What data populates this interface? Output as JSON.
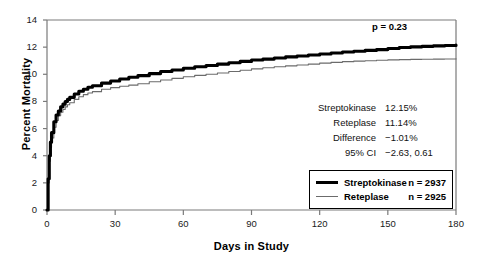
{
  "chart_data": {
    "type": "line",
    "title": "",
    "xlabel": "Days in Study",
    "ylabel": "Percent Mortality",
    "xlim": [
      0,
      180
    ],
    "ylim": [
      0,
      14
    ],
    "xticks": [
      0,
      30,
      60,
      90,
      120,
      150,
      180
    ],
    "yticks": [
      0,
      2,
      4,
      6,
      8,
      10,
      12,
      14
    ],
    "grid": false,
    "legend_position": "lower right",
    "annotations": [
      {
        "name": "p-value",
        "text": "p = 0.23"
      }
    ],
    "series": [
      {
        "name": "Streptokinase",
        "n": 2937,
        "style": "thick-black",
        "final_value": 12.15,
        "x": [
          0,
          0.5,
          1,
          1.5,
          2,
          3,
          4,
          5,
          6,
          7,
          8,
          9,
          10,
          12,
          14,
          16,
          18,
          20,
          24,
          28,
          32,
          36,
          40,
          45,
          50,
          55,
          60,
          65,
          70,
          75,
          80,
          85,
          90,
          95,
          100,
          105,
          110,
          115,
          120,
          125,
          130,
          135,
          140,
          145,
          150,
          155,
          160,
          165,
          170,
          175,
          180
        ],
        "y": [
          0,
          2.3,
          4.0,
          5.0,
          5.7,
          6.5,
          7.0,
          7.3,
          7.6,
          7.8,
          8.0,
          8.15,
          8.3,
          8.55,
          8.75,
          8.9,
          9.05,
          9.15,
          9.35,
          9.5,
          9.65,
          9.78,
          9.9,
          10.05,
          10.2,
          10.32,
          10.45,
          10.55,
          10.65,
          10.75,
          10.85,
          10.95,
          11.05,
          11.12,
          11.2,
          11.28,
          11.35,
          11.42,
          11.5,
          11.57,
          11.64,
          11.7,
          11.76,
          11.82,
          11.9,
          11.97,
          12.02,
          12.06,
          12.09,
          12.12,
          12.15
        ]
      },
      {
        "name": "Reteplase",
        "n": 2925,
        "style": "thin-gray",
        "final_value": 11.14,
        "x": [
          0,
          0.5,
          1,
          1.5,
          2,
          3,
          4,
          5,
          6,
          7,
          8,
          9,
          10,
          12,
          14,
          16,
          18,
          20,
          24,
          28,
          32,
          36,
          40,
          45,
          50,
          55,
          60,
          65,
          70,
          75,
          80,
          85,
          90,
          95,
          100,
          105,
          110,
          115,
          120,
          125,
          130,
          135,
          140,
          145,
          150,
          155,
          160,
          165,
          170,
          175,
          180
        ],
        "y": [
          0,
          2.0,
          3.6,
          4.6,
          5.3,
          6.1,
          6.6,
          6.95,
          7.2,
          7.4,
          7.6,
          7.75,
          7.9,
          8.15,
          8.35,
          8.5,
          8.62,
          8.72,
          8.9,
          9.02,
          9.12,
          9.2,
          9.3,
          9.45,
          9.58,
          9.7,
          9.82,
          9.92,
          10.0,
          10.1,
          10.2,
          10.3,
          10.4,
          10.48,
          10.55,
          10.62,
          10.68,
          10.75,
          10.82,
          10.88,
          10.93,
          10.97,
          11.0,
          11.03,
          11.06,
          11.08,
          11.1,
          11.11,
          11.12,
          11.13,
          11.14
        ]
      }
    ],
    "stats": [
      {
        "label": "Streptokinase",
        "value": "12.15%"
      },
      {
        "label": "Reteplase",
        "value": "11.14%"
      },
      {
        "label": "Difference",
        "value": "−1.01%"
      },
      {
        "label": "95% CI",
        "value": "−2.63, 0.61"
      }
    ],
    "legend": [
      {
        "name": "Streptokinase",
        "n_label": "n = 2937"
      },
      {
        "name": "Reteplase",
        "n_label": "n = 2925"
      }
    ]
  },
  "colors": {
    "axis": "#7a7a7a",
    "streptokinase": "#000000",
    "reteplase": "#6b6b6b",
    "text": "#111111"
  }
}
